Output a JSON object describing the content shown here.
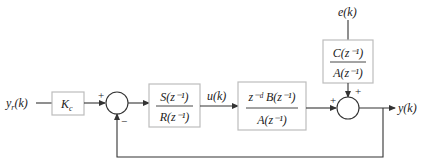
{
  "diagram": {
    "type": "control-block-diagram",
    "signals": {
      "reference": "y_r(k)",
      "reference_base": "y",
      "reference_sub": "r",
      "reference_arg": "(k)",
      "control": "u(k)",
      "disturbance": "e(k)",
      "output": "y(k)"
    },
    "blocks": {
      "gain": {
        "label": "K",
        "sub": "c"
      },
      "controller": {
        "num": "S(z⁻¹)",
        "den": "R(z⁻¹)"
      },
      "plant": {
        "num": "z⁻ᵈ B(z⁻¹)",
        "den": "A(z⁻¹)"
      },
      "noise_filter": {
        "num": "C(z⁻¹)",
        "den": "A(z⁻¹)"
      }
    },
    "summing_junctions": {
      "error_sum": {
        "top_sign": "+",
        "bottom_sign": "−"
      },
      "output_sum": {
        "left_sign": "+",
        "top_sign": "+"
      }
    },
    "colors": {
      "line": "#333333",
      "block_border": "#bdbdbd",
      "text": "#222222"
    }
  }
}
